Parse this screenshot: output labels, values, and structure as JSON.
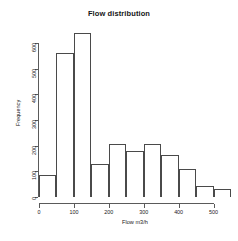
{
  "chart_data": {
    "type": "bar",
    "title": "Flow distribution",
    "xlabel": "Flow m3/h",
    "ylabel": "Frequency",
    "grid": false,
    "legend": null,
    "xlim": [
      0,
      550
    ],
    "ylim": [
      0,
      650
    ],
    "bin_width": 50,
    "bin_edges": [
      0,
      50,
      100,
      150,
      200,
      250,
      300,
      350,
      400,
      450,
      500,
      550
    ],
    "categories": [
      "0-50",
      "50-100",
      "100-150",
      "150-200",
      "200-250",
      "250-300",
      "300-350",
      "350-400",
      "400-450",
      "450-500",
      "500-550"
    ],
    "values": [
      85,
      560,
      640,
      130,
      205,
      180,
      207,
      165,
      110,
      42,
      32
    ],
    "xticks": [
      0,
      100,
      200,
      300,
      400,
      500
    ],
    "xtick_labels": [
      "0",
      "100",
      "200",
      "300",
      "400",
      "500"
    ],
    "yticks": [
      0,
      100,
      200,
      300,
      400,
      500,
      600
    ],
    "ytick_labels": [
      "0",
      "100",
      "200",
      "300",
      "400",
      "500",
      "600"
    ]
  },
  "colors": {
    "background": "#ffffff",
    "bar_outline": "#4a4a4a",
    "bar_fill": "#ffffff",
    "axis": "#5a5a5a",
    "text": "#202020"
  }
}
